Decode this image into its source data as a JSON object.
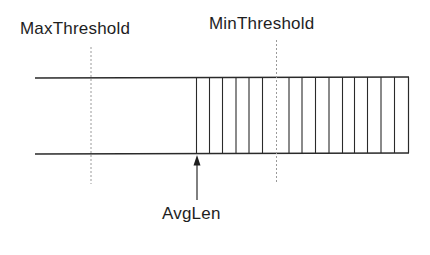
{
  "labels": {
    "max_threshold": "MaxThreshold",
    "min_threshold": "MinThreshold",
    "avg_len": "AvgLen"
  },
  "queue": {
    "packet_count": 16,
    "description": "Queue of fixed-length slots; filled portion on right side"
  },
  "colors": {
    "line": "#2a2a2a",
    "dashed": "#9a9a9a",
    "text": "#1e1e1e",
    "background": "#ffffff"
  }
}
